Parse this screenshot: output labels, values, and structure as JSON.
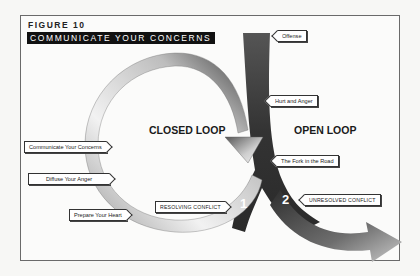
{
  "figure": {
    "number": "FIGURE 10",
    "title": "COMMUNICATE YOUR CONCERNS"
  },
  "diagram": {
    "regions": {
      "closed_loop": "CLOSED LOOP",
      "open_loop": "OPEN LOOP"
    },
    "main_path_labels": {
      "offense": "Offense",
      "hurt_and_anger": "Hurt and Anger",
      "fork_in_the_road": "The Fork in the Road"
    },
    "closed_loop_steps": [
      {
        "label": "Prepare Your Heart"
      },
      {
        "label": "Diffuse Your Anger"
      },
      {
        "label": "Communicate Your Concerns"
      }
    ],
    "branches": [
      {
        "number": "1",
        "label": "RESOLVING CONFLICT"
      },
      {
        "number": "2",
        "label": "UNRESOLVED CONFLICT"
      }
    ]
  },
  "colors": {
    "arrow_dark": "#3a3a3a",
    "arrow_light": "#e8e8e8",
    "frame": "#6a6a6a",
    "title_bg": "#111111"
  }
}
